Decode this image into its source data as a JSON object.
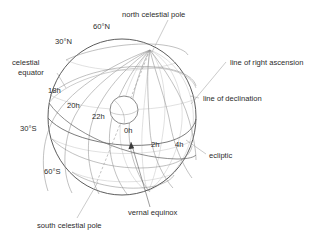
{
  "figure": {
    "type": "celestial-sphere-diagram",
    "background_color": "#ffffff",
    "line_color": "#8d8d8d",
    "outline_color": "#4a4a4a",
    "text_color": "#2b2b2b"
  },
  "labels": {
    "north_celestial_pole": "north celestial pole",
    "south_celestial_pole": "south celestial pole",
    "celestial_equator_line1": "celestial",
    "celestial_equator_line2": "equator",
    "line_of_right_ascension": "line of right ascension",
    "line_of_declination": "line of declination",
    "ecliptic": "ecliptic",
    "vernal_equinox": "vernal equinox"
  },
  "declination_labels": [
    {
      "text": "60°N",
      "x": 93,
      "y": 29
    },
    {
      "text": "30°N",
      "x": 55,
      "y": 44
    },
    {
      "text": "30°S",
      "x": 20,
      "y": 131
    },
    {
      "text": "60°S",
      "x": 44,
      "y": 174
    }
  ],
  "right_ascension_labels": [
    {
      "text": "18h",
      "x": 48,
      "y": 93
    },
    {
      "text": "20h",
      "x": 67,
      "y": 108
    },
    {
      "text": "22h",
      "x": 92,
      "y": 119
    },
    {
      "text": "0h",
      "x": 124,
      "y": 133
    },
    {
      "text": "2h",
      "x": 151,
      "y": 147
    },
    {
      "text": "4h",
      "x": 175,
      "y": 147
    }
  ],
  "sphere": {
    "center_x": 122,
    "center_y": 117,
    "radius": 79,
    "tilt_degrees": 23.5,
    "pole_x": 150,
    "pole_y": 50
  },
  "earth": {
    "center_x": 124,
    "center_y": 110,
    "radius": 14
  }
}
